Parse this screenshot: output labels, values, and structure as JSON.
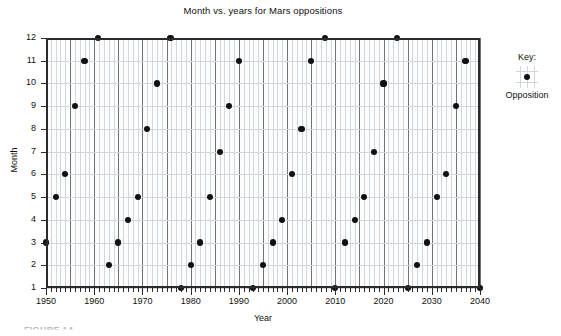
{
  "chart_data": {
    "type": "scatter",
    "title": "Month vs. years for Mars oppositions",
    "xlabel": "Year",
    "ylabel": "Month",
    "xlim": [
      1950,
      2040
    ],
    "ylim": [
      1,
      12
    ],
    "x_major_ticks": [
      1950,
      1960,
      1970,
      1980,
      1990,
      2000,
      2010,
      2020,
      2030,
      2040
    ],
    "x_major_tick_labels": [
      "1950",
      "1960",
      "1970",
      "1980",
      "1990",
      "2000",
      "2010",
      "2020",
      "2030",
      "2040"
    ],
    "x_minor_tick_step": 1,
    "x_gridline_major_step": 5,
    "y_ticks": [
      1,
      2,
      3,
      4,
      5,
      6,
      7,
      8,
      9,
      10,
      11,
      12
    ],
    "y_tick_labels": [
      "1",
      "2",
      "3",
      "4",
      "5",
      "6",
      "7",
      "8",
      "9",
      "10",
      "11",
      "12"
    ],
    "grid": true,
    "grid_minor_vertical": true,
    "legend_position": "right",
    "series": [
      {
        "name": "Opposition",
        "marker": "filled-circle",
        "color": "#111111",
        "points": [
          {
            "x": 1950,
            "y": 3
          },
          {
            "x": 1952,
            "y": 5
          },
          {
            "x": 1954,
            "y": 6
          },
          {
            "x": 1956,
            "y": 9
          },
          {
            "x": 1958,
            "y": 11
          },
          {
            "x": 1960.8,
            "y": 12
          },
          {
            "x": 1963,
            "y": 2
          },
          {
            "x": 1965,
            "y": 3
          },
          {
            "x": 1967,
            "y": 4
          },
          {
            "x": 1969,
            "y": 5
          },
          {
            "x": 1971,
            "y": 8
          },
          {
            "x": 1973,
            "y": 10
          },
          {
            "x": 1975.8,
            "y": 12
          },
          {
            "x": 1978,
            "y": 1
          },
          {
            "x": 1980,
            "y": 2
          },
          {
            "x": 1982,
            "y": 3
          },
          {
            "x": 1984,
            "y": 5
          },
          {
            "x": 1986,
            "y": 7
          },
          {
            "x": 1988,
            "y": 9
          },
          {
            "x": 1990,
            "y": 11
          },
          {
            "x": 1993,
            "y": 1
          },
          {
            "x": 1995,
            "y": 2
          },
          {
            "x": 1997,
            "y": 3
          },
          {
            "x": 1999,
            "y": 4
          },
          {
            "x": 2001,
            "y": 6
          },
          {
            "x": 2003,
            "y": 8
          },
          {
            "x": 2005,
            "y": 11
          },
          {
            "x": 2007.8,
            "y": 12
          },
          {
            "x": 2010,
            "y": 1
          },
          {
            "x": 2012,
            "y": 3
          },
          {
            "x": 2014,
            "y": 4
          },
          {
            "x": 2016,
            "y": 5
          },
          {
            "x": 2018,
            "y": 7
          },
          {
            "x": 2020,
            "y": 10
          },
          {
            "x": 2022.8,
            "y": 12
          },
          {
            "x": 2025,
            "y": 1
          },
          {
            "x": 2027,
            "y": 2
          },
          {
            "x": 2029,
            "y": 3
          },
          {
            "x": 2031,
            "y": 5
          },
          {
            "x": 2033,
            "y": 6
          },
          {
            "x": 2035,
            "y": 9
          },
          {
            "x": 2037,
            "y": 11
          },
          {
            "x": 2040,
            "y": 1
          }
        ]
      }
    ]
  },
  "legend": {
    "title": "Key:",
    "entry_label": "Opposition"
  },
  "caption": {
    "text": "FIGURE 14"
  }
}
